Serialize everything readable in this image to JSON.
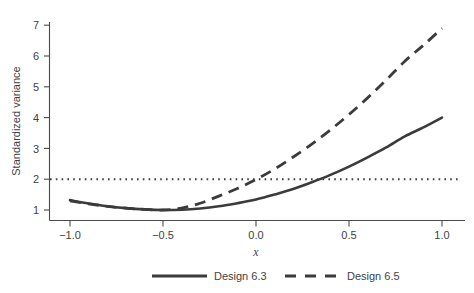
{
  "chart_data": {
    "type": "line",
    "title": "",
    "subtitle": "",
    "xlabel": "x",
    "ylabel": "Standardized variance",
    "xlim": [
      -1.12,
      1.12
    ],
    "ylim": [
      0.62,
      7.35
    ],
    "xticks": [
      -1.0,
      -0.5,
      0.0,
      0.5,
      1.0
    ],
    "xtick_labels": [
      "−1.0",
      "−0.5",
      "0.0",
      "0.5",
      "1.0"
    ],
    "yticks": [
      1,
      2,
      3,
      4,
      5,
      6,
      7
    ],
    "ytick_labels": [
      "1",
      "2",
      "3",
      "4",
      "5",
      "6",
      "7"
    ],
    "grid": false,
    "legend_position": "bottom-outside",
    "reference_lines": [
      {
        "name": "variance-threshold",
        "orientation": "horizontal",
        "value": 2,
        "style": "dotted",
        "label": ""
      }
    ],
    "series": [
      {
        "name": "Design 6.3",
        "style": "solid",
        "color": "#3b3b3b",
        "x": [
          -1.0,
          -0.9,
          -0.8,
          -0.7,
          -0.6,
          -0.5,
          -0.4,
          -0.3,
          -0.2,
          -0.1,
          0.0,
          0.1,
          0.2,
          0.3,
          0.4,
          0.5,
          0.6,
          0.7,
          0.8,
          0.9,
          1.0
        ],
        "values": [
          1.32,
          1.21,
          1.12,
          1.06,
          1.02,
          1.0,
          1.01,
          1.05,
          1.12,
          1.22,
          1.34,
          1.5,
          1.68,
          1.9,
          2.14,
          2.41,
          2.71,
          3.03,
          3.39,
          3.68,
          4.0
        ]
      },
      {
        "name": "Design 6.5",
        "style": "dashed",
        "color": "#3b3b3b",
        "x": [
          -1.0,
          -0.9,
          -0.8,
          -0.7,
          -0.6,
          -0.5,
          -0.4,
          -0.3,
          -0.2,
          -0.1,
          0.0,
          0.1,
          0.2,
          0.3,
          0.4,
          0.5,
          0.6,
          0.7,
          0.8,
          0.9,
          1.0
        ],
        "values": [
          1.3,
          1.2,
          1.12,
          1.06,
          1.02,
          1.0,
          1.06,
          1.22,
          1.45,
          1.7,
          1.99,
          2.33,
          2.72,
          3.14,
          3.6,
          4.1,
          4.64,
          5.22,
          5.83,
          6.35,
          6.9
        ]
      }
    ],
    "annotations": []
  },
  "legend": {
    "entries": [
      {
        "label": "Design 6.3",
        "style": "solid"
      },
      {
        "label": "Design 6.5",
        "style": "dashed"
      }
    ]
  }
}
